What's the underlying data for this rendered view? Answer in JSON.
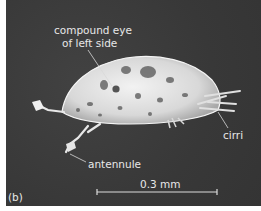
{
  "figure": {
    "panel_label": "(b)",
    "labels": {
      "compound_eye_line1": "compound eye",
      "compound_eye_line2": "of left side",
      "cirri": "cirri",
      "antennule": "antennule"
    },
    "scale_bar": {
      "text": "0.3 mm"
    },
    "colors": {
      "background": "#3b3b3b",
      "specimen": "#e6e6e6",
      "text": "#e8e8e8"
    }
  }
}
